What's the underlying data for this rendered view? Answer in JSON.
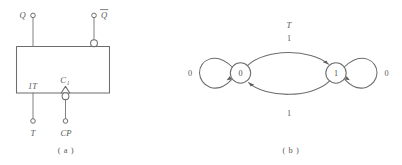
{
  "figure": {
    "panel_a": {
      "caption": "( a )",
      "output_q_label": "Q",
      "output_qbar_label": "Q",
      "output_qbar_overbar": true,
      "input_t_inner_label": "1T",
      "input_clock_inner_label": "C",
      "input_clock_inner_subscript": "1",
      "input_t_label": "T",
      "input_clock_label": "CP",
      "symbol_name": "T flip-flop logic symbol"
    },
    "panel_b": {
      "caption": "( b )",
      "diagram_name": "T flip-flop state transition diagram",
      "states": [
        {
          "id": "s0",
          "label": "0"
        },
        {
          "id": "s1",
          "label": "1"
        }
      ],
      "self_loops": [
        {
          "state": "s0",
          "label": "0",
          "side": "left"
        },
        {
          "state": "s1",
          "label": "0",
          "side": "right"
        }
      ],
      "transitions": [
        {
          "from": "s0",
          "to": "s1",
          "input_label": "T",
          "label": "1",
          "position": "top"
        },
        {
          "from": "s1",
          "to": "s0",
          "label": "1",
          "position": "bottom"
        }
      ]
    }
  },
  "colors": {
    "ink": "#6d6d6d",
    "text": "#5a5a5a",
    "paper": "#ffffff"
  }
}
